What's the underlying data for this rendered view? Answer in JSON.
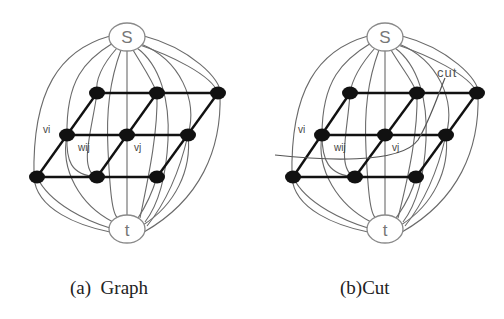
{
  "figures": [
    {
      "id": "a",
      "caption": "(a)  Graph",
      "source_label": "S",
      "sink_label": "t",
      "node_labels": {
        "vi": "vi",
        "wij": "wij",
        "vj": "vj"
      },
      "grid": "3x3 parallelogram lattice"
    },
    {
      "id": "b",
      "caption": "(b)Cut",
      "source_label": "S",
      "sink_label": "t",
      "node_labels": {
        "vi": "vi",
        "wij": "wij",
        "vj": "vj"
      },
      "cut_label": "cut",
      "grid": "3x3 parallelogram lattice"
    }
  ],
  "colors": {
    "node": "#111111",
    "terminal_outline": "#8a8a8a",
    "link": "#6a6a6a",
    "background": "#ffffff"
  }
}
